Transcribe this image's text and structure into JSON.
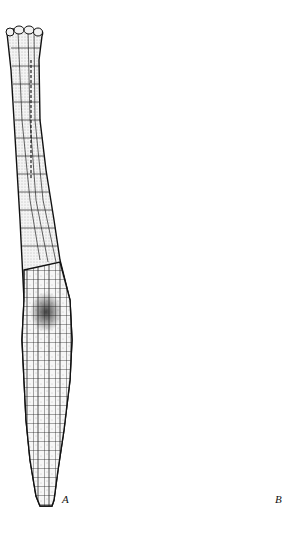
{
  "figure": {
    "panels": [
      {
        "id": "A",
        "label": "A",
        "description": "Slender cellular structure with long neck and swollen venter containing dark central cell"
      },
      {
        "id": "B",
        "label": "B",
        "description": "Elongated club-shaped body densely packed with small cells, pale jacket layer cap, short stalk"
      }
    ]
  },
  "colors": {
    "background": "#ffffff",
    "ink": "#111111",
    "dense_fill": "#3a3a3a",
    "jacket_fill": "#ececec"
  }
}
